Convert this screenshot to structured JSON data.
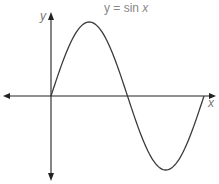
{
  "chart_data": {
    "type": "line",
    "title": "y = sin x",
    "xlabel": "x",
    "ylabel": "y",
    "function": "sin",
    "x": [
      0,
      0.785,
      1.571,
      2.356,
      3.142,
      3.927,
      4.712,
      5.498,
      6.283
    ],
    "values": [
      0,
      0.707,
      1,
      0.707,
      0,
      -0.707,
      -1,
      -0.707,
      0
    ],
    "xlim": [
      -1.25,
      6.5
    ],
    "ylim": [
      -1.1,
      1.1
    ],
    "grid": false,
    "legend": null,
    "tick_labels": []
  },
  "labels": {
    "title_prefix": "y = sin ",
    "title_var": "x",
    "x_axis": "x",
    "y_axis": "y"
  },
  "colors": {
    "curve": "#3a3a3a",
    "axes": "#222222",
    "text": "#888888"
  }
}
